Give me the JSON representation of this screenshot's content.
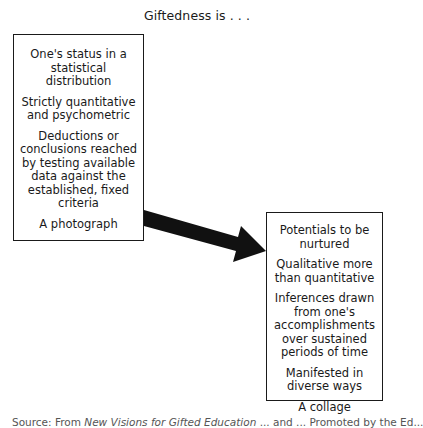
{
  "title": "Giftedness is . . .",
  "left_box": {
    "items": [
      "One's status in a statistical distribution",
      "Strictly quantitative and psychometric",
      "Deductions or conclusions reached by testing available data against the established, fixed criteria",
      "A photograph"
    ]
  },
  "right_box": {
    "items": [
      "Potentials to be nurtured",
      "Qualitative more than quantitative",
      "Inferences drawn from one's accomplishments over sustained periods of time",
      "Manifested in diverse ways",
      "A collage"
    ]
  },
  "arrow": {
    "from": "left_box",
    "to": "right_box",
    "color": "#111111"
  },
  "caption": {
    "prefix": "Source: From ",
    "book_title": "New Visions for Gifted Education",
    "rest": " ... and ... Promoted by the Ed..."
  }
}
